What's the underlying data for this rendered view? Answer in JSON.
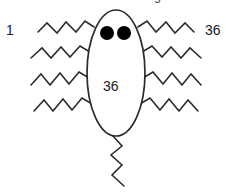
{
  "figure": {
    "title_clipped": "A schematic of the organism",
    "stroke_color": "#2b2b2b",
    "fill_color": "#ffffff",
    "eye_color": "#000000",
    "background_color": "#ffffff",
    "body_shape": "ellipse",
    "body_label": "36",
    "left_label": "1",
    "right_label": "36",
    "leg_count_left": 4,
    "leg_count_right": 4,
    "tail_count": 1,
    "eye_count": 2
  },
  "geometry": {
    "body": {
      "cx": 116,
      "cy": 73,
      "rx": 29,
      "ry": 63
    },
    "eyes": [
      {
        "cx": 107,
        "cy": 33,
        "r": 7
      },
      {
        "cx": 124,
        "cy": 33,
        "r": 7
      }
    ],
    "legs_left": [
      "M 94 27 L 85 21 L 76 32 L 66 22 L 57 33 L 47 23 L 38 32",
      "M 90 52 L 80 46 L 70 57 L 61 47 L 51 58 L 42 48 L 31 58",
      "M 89 78 L 79 72 L 69 84 L 60 73 L 50 85 L 41 74 L 31 85",
      "M 92 104 L 82 98 L 72 110 L 63 99 L 53 111 L 44 100 L 34 111"
    ],
    "legs_right": [
      "M 138 27 L 147 21 L 156 32 L 166 22 L 175 33 L 185 23 L 194 32",
      "M 142 52 L 152 46 L 162 57 L 171 47 L 181 58 L 190 48 L 201 58",
      "M 143 78 L 153 72 L 163 84 L 172 73 L 182 85 L 191 74 L 201 85",
      "M 140 104 L 150 98 L 160 110 L 169 99 L 179 111 L 188 100 L 198 111"
    ],
    "tail": "M 113 136 L 122 146 L 111 155 L 122 165 L 112 175 L 124 186"
  }
}
